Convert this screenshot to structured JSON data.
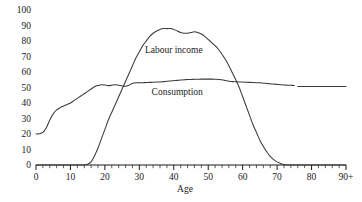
{
  "chart_data": {
    "type": "line",
    "title": "",
    "xlabel": "Age",
    "ylabel": "",
    "xlim": [
      0,
      90
    ],
    "ylim": [
      0,
      100
    ],
    "grid": false,
    "legend_position": "inline-annotation",
    "x_tick_labels": [
      "0",
      "10",
      "20",
      "30",
      "40",
      "50",
      "60",
      "70",
      "80",
      "90+"
    ],
    "x_tick_values": [
      0,
      10,
      20,
      30,
      40,
      50,
      60,
      70,
      80,
      90
    ],
    "x_minor_tick_step": 2,
    "y_tick_labels": [
      "0",
      "10",
      "20",
      "30",
      "40",
      "50",
      "60",
      "70",
      "80",
      "90",
      "100"
    ],
    "y_tick_values": [
      0,
      10,
      20,
      30,
      40,
      50,
      60,
      70,
      80,
      90,
      100
    ],
    "series": [
      {
        "name": "Labour income",
        "label_x": 40,
        "label_y": 72,
        "color": "#3a3a3a",
        "x": [
          0,
          2,
          4,
          6,
          8,
          10,
          12,
          14,
          15,
          16,
          17,
          18,
          19,
          20,
          21,
          22,
          23,
          24,
          25,
          26,
          27,
          28,
          29,
          30,
          31,
          32,
          33,
          34,
          35,
          36,
          37,
          38,
          39,
          40,
          41,
          42,
          43,
          44,
          45,
          46,
          47,
          48,
          49,
          50,
          51,
          52,
          53,
          54,
          55,
          56,
          57,
          58,
          59,
          60,
          61,
          62,
          63,
          64,
          65,
          66,
          67,
          68,
          69,
          70,
          71,
          72,
          73,
          74,
          76,
          78,
          80,
          82,
          84,
          86,
          88,
          90
        ],
        "y": [
          0,
          0,
          0,
          0,
          0,
          0,
          0,
          0,
          0.5,
          2,
          6,
          11,
          17,
          23,
          29,
          34,
          39,
          44,
          49,
          54,
          59,
          64,
          69,
          73,
          77,
          80,
          83,
          85,
          86.5,
          87.5,
          88,
          88,
          88,
          87.5,
          86.5,
          85.5,
          85,
          85,
          85.5,
          86,
          85.5,
          84.5,
          83,
          81,
          79,
          77,
          74.5,
          71.5,
          68,
          64,
          59.5,
          55,
          50,
          44,
          38,
          32,
          26,
          21,
          16,
          12,
          8.5,
          5.5,
          3.5,
          2,
          1,
          0.3,
          0,
          0,
          0,
          0,
          0,
          0,
          0,
          0,
          0,
          0
        ]
      },
      {
        "name": "Consumption",
        "label_x": 41,
        "label_y": 45,
        "color": "#3a3a3a",
        "x": [
          0,
          1,
          2,
          3,
          4,
          5,
          6,
          7,
          8,
          9,
          10,
          11,
          12,
          13,
          14,
          15,
          16,
          17,
          18,
          19,
          20,
          21,
          22,
          23,
          24,
          25,
          26,
          27,
          28,
          29,
          30,
          31,
          32,
          33,
          34,
          35,
          36,
          37,
          38,
          39,
          40,
          41,
          42,
          43,
          44,
          45,
          46,
          47,
          48,
          49,
          50,
          51,
          52,
          53,
          54,
          55,
          56,
          57,
          58,
          59,
          60,
          61,
          62,
          63,
          64,
          65,
          66,
          67,
          68,
          69,
          70,
          71,
          72,
          73,
          74,
          75,
          76,
          77,
          78,
          80,
          82,
          84,
          86,
          88,
          90
        ],
        "y": [
          20,
          20.2,
          21,
          24,
          29,
          33,
          35.5,
          37,
          38,
          39,
          40,
          41.5,
          43,
          44.5,
          46,
          47.5,
          49,
          50.5,
          51.3,
          51.8,
          51.6,
          51.2,
          51.5,
          51.8,
          51.5,
          51,
          50.8,
          51.5,
          52.6,
          53,
          53,
          53.1,
          53.2,
          53.3,
          53.4,
          53.5,
          53.6,
          53.8,
          54,
          54.2,
          54.4,
          54.6,
          54.8,
          55,
          55.1,
          55.2,
          55.3,
          55.3,
          55.4,
          55.4,
          55.4,
          55.4,
          55.3,
          55.2,
          55,
          54.5,
          54,
          53.8,
          53.7,
          53.6,
          53.5,
          53.4,
          53.3,
          53.2,
          53.1,
          53,
          52.8,
          52.6,
          52.4,
          52.2,
          52,
          51.8,
          51.6,
          51.5,
          51.4,
          51.3,
          50.6,
          50.6,
          50.6,
          50.6,
          50.6,
          50.6,
          50.6,
          50.6,
          50.6
        ],
        "break_after_x": 75
      }
    ]
  }
}
